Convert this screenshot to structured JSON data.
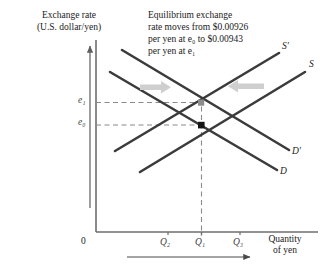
{
  "figure": {
    "title_vertical_axis_line1": "Exchange rate",
    "title_vertical_axis_line2": "(U.S. dollar/yen)",
    "annotation_line1": "Equilibrium exchange",
    "annotation_line2": "rate moves from $0.00926",
    "annotation_line3": "per yen at e₀ to $0.00943",
    "annotation_line4": "per yen at e₁",
    "origin_label": "0",
    "x_axis_label_line1": "Quantity",
    "x_axis_label_line2": "of yen",
    "colors": {
      "curve": "#3b3b3b",
      "dashed": "#7d7d7d",
      "axis": "#6e6e6e",
      "shift_arrow": "#c9c9c9",
      "equilibrium_old": "#111111",
      "equilibrium_new": "#8c8c8c",
      "text": "#1a1a1a"
    },
    "curves": [
      {
        "id": "supply-prime",
        "label": "S′",
        "type": "supply",
        "note": "shifted supply curve"
      },
      {
        "id": "supply",
        "label": "S",
        "type": "supply",
        "note": "original supply curve"
      },
      {
        "id": "demand-prime",
        "label": "D′",
        "type": "demand",
        "note": "shifted demand curve"
      },
      {
        "id": "demand",
        "label": "D",
        "type": "demand",
        "note": "original demand curve"
      }
    ],
    "price_ticks": [
      {
        "id": "e1",
        "label": "e₁",
        "note": "new equilibrium exchange rate, $0.00943 per yen"
      },
      {
        "id": "e0",
        "label": "e₀",
        "note": "original equilibrium exchange rate, $0.00926 per yen"
      }
    ],
    "quantity_ticks": [
      {
        "id": "q2",
        "label": "Q₂"
      },
      {
        "id": "q1",
        "label": "Q₁"
      },
      {
        "id": "q3",
        "label": "Q₃"
      }
    ],
    "shift_arrows": [
      {
        "id": "left-shift-arrow",
        "direction": "right",
        "note": "demand curve shifts right"
      },
      {
        "id": "right-shift-arrow",
        "direction": "left",
        "note": "supply curve shifts left"
      }
    ],
    "bottom_arrow": {
      "id": "quantity-direction-arrow",
      "direction": "right"
    }
  }
}
